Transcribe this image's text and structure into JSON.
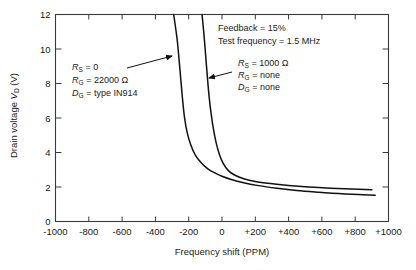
{
  "chart_data": {
    "type": "line",
    "title": "",
    "xlabel": "Frequency shift (PPM)",
    "ylabel": "Drain voltage V_D (V)",
    "xlim": [
      -1000,
      1000
    ],
    "ylim": [
      0,
      12
    ],
    "grid": false,
    "legend_position": "none",
    "xticks": [
      -1000,
      -800,
      -600,
      -400,
      -200,
      0,
      200,
      400,
      600,
      800,
      1000
    ],
    "xtick_labels": [
      "-1000",
      "-800",
      "-600",
      "-400",
      "-200",
      "0",
      "+200",
      "+400",
      "+600",
      "+800",
      "+1000"
    ],
    "yticks": [
      0,
      2,
      4,
      6,
      8,
      10,
      12
    ],
    "ytick_labels": [
      "0",
      "2",
      "4",
      "6",
      "8",
      "10",
      "12"
    ],
    "series": [
      {
        "name": "RS = 0, RG = 22000 ohm, DG = type IN914",
        "points": [
          [
            -290,
            12.0
          ],
          [
            -270,
            10.6
          ],
          [
            -258,
            9.4
          ],
          [
            -248,
            8.3
          ],
          [
            -238,
            7.2
          ],
          [
            -226,
            6.1
          ],
          [
            -210,
            5.2
          ],
          [
            -188,
            4.45
          ],
          [
            -160,
            3.85
          ],
          [
            -125,
            3.4
          ],
          [
            -85,
            3.05
          ],
          [
            -40,
            2.8
          ],
          [
            0,
            2.62
          ],
          [
            60,
            2.42
          ],
          [
            130,
            2.25
          ],
          [
            220,
            2.08
          ],
          [
            330,
            1.93
          ],
          [
            450,
            1.8
          ],
          [
            580,
            1.7
          ],
          [
            700,
            1.62
          ],
          [
            820,
            1.56
          ],
          [
            920,
            1.52
          ]
        ]
      },
      {
        "name": "RS = 1000 ohm, RG = none, DG = none",
        "points": [
          [
            -120,
            12.0
          ],
          [
            -108,
            10.8
          ],
          [
            -98,
            9.6
          ],
          [
            -88,
            8.4
          ],
          [
            -78,
            7.3
          ],
          [
            -66,
            6.3
          ],
          [
            -52,
            5.4
          ],
          [
            -36,
            4.6
          ],
          [
            -16,
            3.9
          ],
          [
            8,
            3.35
          ],
          [
            38,
            2.95
          ],
          [
            78,
            2.68
          ],
          [
            130,
            2.48
          ],
          [
            200,
            2.32
          ],
          [
            290,
            2.2
          ],
          [
            400,
            2.09
          ],
          [
            520,
            2.0
          ],
          [
            650,
            1.93
          ],
          [
            780,
            1.88
          ],
          [
            900,
            1.84
          ]
        ]
      }
    ],
    "annotations": [
      {
        "id": "conditions",
        "lines": [
          "Feedback = 15%",
          "Test frequency = 1.5 MHz"
        ]
      },
      {
        "id": "left-curve-params",
        "lines": [
          {
            "sym": "R",
            "sub": "S",
            "rest": "= 0"
          },
          {
            "sym": "R",
            "sub": "G",
            "rest": "= 22000 Ω"
          },
          {
            "sym": "D",
            "sub": "G",
            "rest": "= type IN914"
          }
        ]
      },
      {
        "id": "right-curve-params",
        "lines": [
          {
            "sym": "R",
            "sub": "S",
            "rest": "= 1000 Ω"
          },
          {
            "sym": "R",
            "sub": "G",
            "rest": "= none"
          },
          {
            "sym": "D",
            "sub": "G",
            "rest": "= none"
          }
        ]
      }
    ]
  },
  "axes": {
    "xlabel": "Frequency shift (PPM)",
    "ylabel_pre": "Drain voltage ",
    "ylabel_sym": "V",
    "ylabel_sub": "D",
    "ylabel_post": " (V)"
  },
  "annotations": {
    "feedback": "Feedback = 15%",
    "test_frequency": "Test frequency = 1.5 MHz",
    "left": {
      "l1_sym": "R",
      "l1_sub": "S",
      "l1_rest": "= 0",
      "l2_sym": "R",
      "l2_sub": "G",
      "l2_rest": "= 22000 Ω",
      "l3_sym": "D",
      "l3_sub": "G",
      "l3_rest": "= type IN914"
    },
    "right": {
      "l1_sym": "R",
      "l1_sub": "S",
      "l1_rest": "= 1000 Ω",
      "l2_sym": "R",
      "l2_sub": "G",
      "l2_rest": "= none",
      "l3_sym": "D",
      "l3_sub": "G",
      "l3_rest": "= none"
    }
  },
  "style": {
    "line_color": "#111111",
    "axis_color": "#3a3a3a",
    "background": "#ffffff"
  }
}
